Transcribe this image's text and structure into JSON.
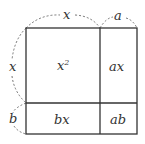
{
  "diagram": {
    "top_labels": {
      "x": "x",
      "a": "a"
    },
    "side_labels": {
      "x": "x",
      "b": "b"
    },
    "cells": {
      "x2": "x",
      "x2_sup": "2",
      "ax": "ax",
      "bx": "bx",
      "ab": "ab"
    },
    "stroke_color": "#333333"
  }
}
